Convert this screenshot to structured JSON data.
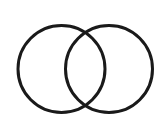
{
  "diagram": {
    "type": "venn",
    "sets": [
      {
        "name": "left-set",
        "cx": 61.5,
        "cy": 69,
        "r": 43.5
      },
      {
        "name": "right-set",
        "cx": 109,
        "cy": 69,
        "r": 43.5
      }
    ],
    "stroke_color": "#1a1a1a",
    "stroke_width": 3,
    "background": "#ffffff"
  }
}
